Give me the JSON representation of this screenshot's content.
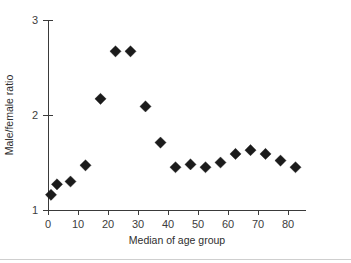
{
  "chart_data": {
    "type": "scatter",
    "title": "",
    "xlabel": "Median of age group",
    "ylabel": "Male/female ratio",
    "xlim": [
      -2,
      88
    ],
    "ylim": [
      1,
      3
    ],
    "xticks": [
      0,
      10,
      20,
      30,
      40,
      50,
      60,
      70,
      80
    ],
    "xtick_labels": [
      "0",
      "10",
      "20",
      "30",
      "40",
      "50",
      "60",
      "70",
      "80"
    ],
    "yticks": [
      1,
      2,
      3
    ],
    "ytick_labels": [
      "1",
      "2",
      "3"
    ],
    "grid": false,
    "legend": null,
    "marker": "diamond",
    "marker_color": "#1b1b1b",
    "x": [
      1,
      3,
      7.5,
      12.5,
      17.5,
      22.5,
      27.5,
      32.5,
      37.5,
      42.5,
      47.5,
      52.5,
      57.5,
      62.5,
      67.5,
      72.5,
      77.5,
      82.5
    ],
    "y": [
      1.16,
      1.27,
      1.3,
      1.47,
      2.17,
      2.67,
      2.67,
      2.09,
      1.71,
      1.45,
      1.48,
      1.45,
      1.5,
      1.59,
      1.63,
      1.59,
      1.52,
      1.45
    ],
    "points": [
      {
        "x": 1,
        "y": 1.16
      },
      {
        "x": 3,
        "y": 1.27
      },
      {
        "x": 7.5,
        "y": 1.3
      },
      {
        "x": 12.5,
        "y": 1.47
      },
      {
        "x": 17.5,
        "y": 2.17
      },
      {
        "x": 22.5,
        "y": 2.67
      },
      {
        "x": 27.5,
        "y": 2.67
      },
      {
        "x": 32.5,
        "y": 2.09
      },
      {
        "x": 37.5,
        "y": 1.71
      },
      {
        "x": 42.5,
        "y": 1.45
      },
      {
        "x": 47.5,
        "y": 1.48
      },
      {
        "x": 52.5,
        "y": 1.45
      },
      {
        "x": 57.5,
        "y": 1.5
      },
      {
        "x": 62.5,
        "y": 1.59
      },
      {
        "x": 67.5,
        "y": 1.63
      },
      {
        "x": 72.5,
        "y": 1.59
      },
      {
        "x": 77.5,
        "y": 1.52
      },
      {
        "x": 82.5,
        "y": 1.45
      }
    ]
  }
}
